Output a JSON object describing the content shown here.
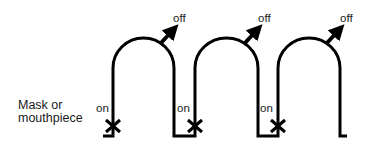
{
  "diagram": {
    "side_label_line1": "Mask or",
    "side_label_line2": "mouthpiece",
    "cycles": [
      {
        "on_label": "on",
        "off_label": "off"
      },
      {
        "on_label": "on",
        "off_label": "off"
      },
      {
        "on_label": "on",
        "off_label": "off"
      }
    ],
    "colors": {
      "stroke": "#000000",
      "text": "#1a1a1a",
      "background": "#ffffff"
    }
  }
}
